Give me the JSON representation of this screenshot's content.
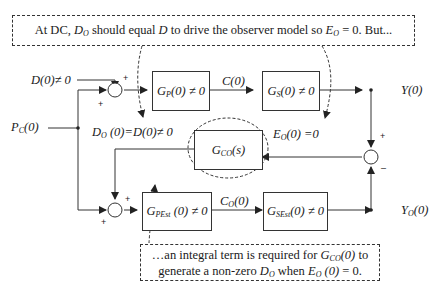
{
  "top_note": {
    "text_html": "At DC, <i>D<sub>O</sub></i> should equal <i>D</i> to drive the observer model so <i>E<sub>O</sub></i> = 0.  But..."
  },
  "bottom_note": {
    "line1_html": "…an integral term is required for <i>G<sub>CO</sub>(0)</i> to",
    "line2_html": "generate a non-zero <i>D<sub>O</sub></i> when <i>E<sub>O</sub> (0)</i> = 0."
  },
  "inputs": {
    "disturbance_html": "D(0)≠ 0",
    "command_html": "P<sub>C</sub>(0)"
  },
  "blocks": {
    "gp_html": "G<sub>P</sub>(0) ≠ 0",
    "gs_html": "G<sub>S</sub>(0) ≠ 0",
    "gco_html": "G<sub>CO</sub>(s)",
    "gpest_html": "G<sub>PEst</sub> (0) ≠ 0",
    "gsest_html": "G<sub>SEst</sub>(0) ≠ 0"
  },
  "signals": {
    "c_html": "C(0)",
    "y_html": "Y(0)",
    "do_html": "D<sub>O</sub> (0)=D(0)≠ 0",
    "eo_html": "E<sub>O</sub>(0) =0",
    "co_html": "C<sub>O</sub>(0)",
    "yo_html": "Y<sub>O</sub>(0)"
  },
  "signs": {
    "plus": "+",
    "minus": "–"
  }
}
